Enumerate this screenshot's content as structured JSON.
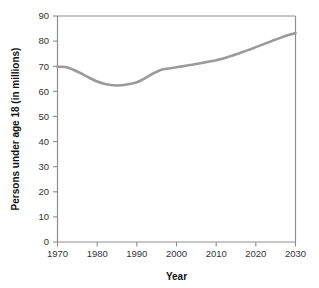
{
  "chart_data": {
    "type": "line",
    "title": "",
    "xlabel": "Year",
    "ylabel": "Persons under age 18 (in millions)",
    "xlim": [
      1970,
      2030
    ],
    "ylim": [
      0,
      90
    ],
    "xticks": [
      1970,
      1980,
      1990,
      2000,
      2010,
      2020,
      2030
    ],
    "yticks": [
      0,
      10,
      20,
      30,
      40,
      50,
      60,
      70,
      80,
      90
    ],
    "grid": false,
    "legend": "none",
    "line_color": "#9a9a9a",
    "axis_color": "#8d8d8d",
    "series": [
      {
        "name": "Persons under age 18",
        "x": [
          1970,
          1972,
          1974,
          1976,
          1978,
          1980,
          1982,
          1984,
          1986,
          1988,
          1990,
          1992,
          1994,
          1996,
          1998,
          2000,
          2002,
          2004,
          2006,
          2008,
          2010,
          2012,
          2014,
          2016,
          2018,
          2020,
          2022,
          2024,
          2026,
          2028,
          2030
        ],
        "values": [
          69.8,
          69.7,
          68.6,
          67.1,
          65.4,
          63.9,
          62.9,
          62.4,
          62.4,
          62.9,
          63.6,
          65.2,
          67.0,
          68.5,
          69.1,
          69.6,
          70.1,
          70.6,
          71.2,
          71.8,
          72.4,
          73.2,
          74.2,
          75.3,
          76.4,
          77.6,
          78.8,
          80.0,
          81.2,
          82.3,
          83.2
        ]
      }
    ]
  },
  "axis": {
    "x_tick_labels": [
      "1970",
      "1980",
      "1990",
      "2000",
      "2010",
      "2020",
      "2030"
    ],
    "y_tick_labels": [
      "0",
      "10",
      "20",
      "30",
      "40",
      "50",
      "60",
      "70",
      "80",
      "90"
    ],
    "x_title": "Year",
    "y_title": "Persons under age 18 (in millions)"
  }
}
